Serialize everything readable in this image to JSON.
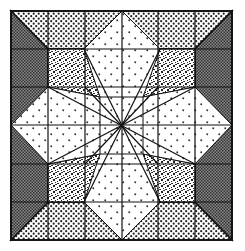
{
  "figure": {
    "kind": "quilt-block-illustration",
    "grid": {
      "rows": 6,
      "cols": 6
    },
    "colors": {
      "background": "#ffffff",
      "line": "#111111",
      "crosshatch_fill": "#6a6a6a",
      "dot_fill": "#222222"
    },
    "fabrics": [
      {
        "name": "dark-crosshatch",
        "location": "left and right border triangles"
      },
      {
        "name": "dotted",
        "location": "top and bottom border trapezoids"
      },
      {
        "name": "speckled",
        "location": "four diagonal kite patches"
      },
      {
        "name": "white-with-hearts",
        "location": "central cross / star points"
      }
    ]
  }
}
